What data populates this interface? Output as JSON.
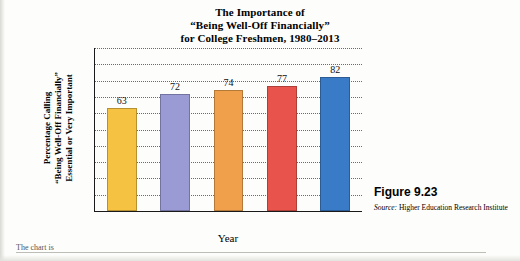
{
  "figure": {
    "title_lines": [
      "The Importance of",
      "“Being Well-Off Financially”",
      "for College Freshmen, 1980–2013"
    ],
    "label": "Figure 9.23",
    "source_word": "Source:",
    "source_text": " Higher Education Research Institute",
    "stray_text": "The chart is"
  },
  "chart_data": {
    "type": "bar",
    "title": "The Importance of “Being Well-Off Financially” for College Freshmen, 1980–2013",
    "xlabel": "Year",
    "ylabel": "Percentage Calling “Being Well-Off Financially” Essential or Very Important",
    "ylabel_lines": [
      "Percentage Calling",
      "“Being Well-Off Financially”",
      "Essential or Very Important"
    ],
    "categories": [
      "1980",
      "1990",
      "2000",
      "2010",
      "2013"
    ],
    "values": [
      63,
      72,
      74,
      77,
      82
    ],
    "bar_colors": [
      "#f5c242",
      "#9a9ad4",
      "#f0a04a",
      "#e8544b",
      "#3a7bc8"
    ],
    "ylim": [
      0,
      100
    ],
    "yticks": [
      10,
      20,
      30,
      40,
      50,
      60,
      70,
      80,
      90,
      100
    ],
    "ytick_labels": [
      "10%",
      "20%",
      "30%",
      "40%",
      "50%",
      "60%",
      "70%",
      "80%",
      "90%",
      "100%"
    ],
    "grid": true,
    "legend": "none"
  }
}
